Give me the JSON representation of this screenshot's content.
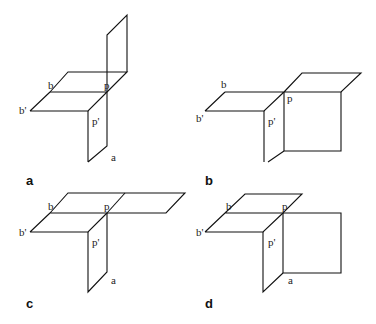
{
  "figure": {
    "panels": [
      {
        "id": "a",
        "label": "a",
        "points": {
          "b": "b",
          "b_prime": "b'",
          "p": "p",
          "p_prime": "p'",
          "a": "a"
        }
      },
      {
        "id": "b",
        "label": "b",
        "points": {
          "b": "b",
          "b_prime": "b'",
          "p": "p",
          "p_prime": "p'"
        }
      },
      {
        "id": "c",
        "label": "c",
        "points": {
          "b": "b",
          "b_prime": "b'",
          "p": "p",
          "p_prime": "p'",
          "a": "a"
        }
      },
      {
        "id": "d",
        "label": "d",
        "points": {
          "b": "b",
          "b_prime": "b'",
          "p": "p",
          "p_prime": "p'",
          "a": "a"
        }
      }
    ]
  }
}
